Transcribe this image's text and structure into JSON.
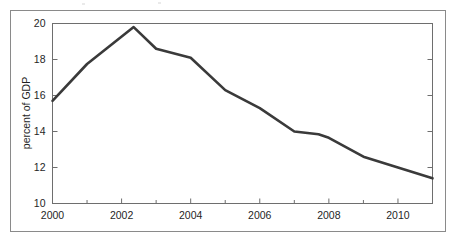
{
  "figure": {
    "frame_color": "#8a8a8a",
    "axes_color": "#6e6e6e",
    "line_color": "#3a3a3a",
    "background": "#ffffff",
    "tick_label_color": "#1f1f1f"
  },
  "chart_data": {
    "type": "line",
    "title": "",
    "subtitle": "",
    "xlabel": "",
    "ylabel": "percent of GDP",
    "xlim": [
      2000,
      2011
    ],
    "ylim": [
      10,
      20
    ],
    "grid": false,
    "legend": null,
    "x_tick_labels": [
      "2000",
      "2002",
      "2004",
      "2006",
      "2008",
      "2010"
    ],
    "x_tick_values": [
      2000,
      2002,
      2004,
      2006,
      2008,
      2010
    ],
    "x_minor_ticks": [
      2001,
      2003,
      2005,
      2007,
      2009,
      2011
    ],
    "y_tick_labels": [
      "10",
      "12",
      "14",
      "16",
      "18",
      "20"
    ],
    "y_tick_values": [
      10,
      12,
      14,
      16,
      18,
      20
    ],
    "x": [
      2000,
      2001,
      2002.35,
      2003,
      2004,
      2005,
      2006,
      2007,
      2007.7,
      2008,
      2009,
      2010,
      2011
    ],
    "values": [
      15.7,
      17.75,
      19.8,
      18.6,
      18.1,
      16.3,
      15.3,
      14.0,
      13.85,
      13.65,
      12.6,
      12.0,
      11.4
    ],
    "series": [
      {
        "name": "percent of GDP",
        "values": [
          15.7,
          17.75,
          19.8,
          18.6,
          18.1,
          16.3,
          15.3,
          14.0,
          13.85,
          13.65,
          12.6,
          12.0,
          11.4
        ]
      }
    ]
  }
}
